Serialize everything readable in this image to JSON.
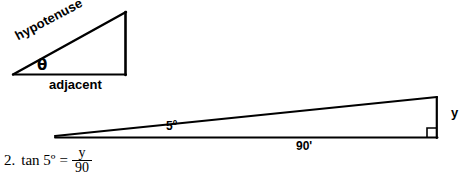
{
  "figure": {
    "background_color": "#ffffff",
    "stroke_color": "#000000",
    "reference_triangle": {
      "hypotenuse_label": "hypotenuse",
      "angle_label": "θ",
      "adjacent_label": "adjacent"
    },
    "problem_triangle": {
      "angle_label": "5º",
      "base_label": "90'",
      "opposite_label": "y",
      "right_angle_marker": "right-angle-square"
    }
  },
  "equation": {
    "number": "2.",
    "lhs": "tan 5º",
    "equals": "=",
    "numerator": "y",
    "denominator": "90"
  }
}
